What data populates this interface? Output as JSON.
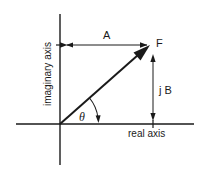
{
  "diagram": {
    "type": "complex-plane-phasor",
    "colors": {
      "stroke": "#1a1a1a",
      "background": "#ffffff"
    },
    "axes": {
      "horizontal_label": "real axis",
      "vertical_label": "imaginary axis"
    },
    "vector": {
      "label": "F",
      "angle_label": "θ"
    },
    "components": {
      "real_label": "A",
      "imaginary_label": "j B"
    }
  }
}
